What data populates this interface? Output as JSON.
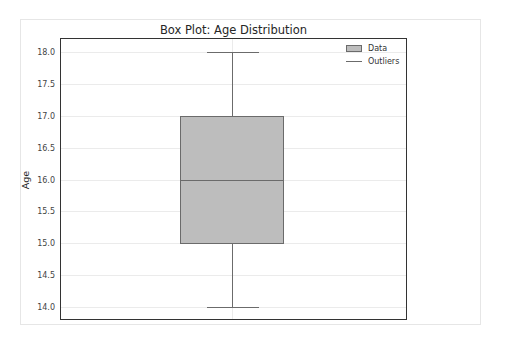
{
  "chart_data": {
    "type": "box",
    "title": "Box Plot: Age Distribution",
    "xlabel": "",
    "ylabel": "Age",
    "ylim": [
      13.8,
      18.2
    ],
    "yticks": [
      "14.0",
      "14.5",
      "15.0",
      "15.5",
      "16.0",
      "16.5",
      "17.0",
      "17.5",
      "18.0"
    ],
    "grid": true,
    "legend": {
      "position": "upper right",
      "entries": [
        "Data",
        "Outliers"
      ]
    },
    "series": [
      {
        "name": "Data",
        "min": 14.0,
        "q1": 15.0,
        "median": 16.0,
        "q3": 17.0,
        "max": 18.0,
        "outliers": []
      }
    ],
    "colors": {
      "box_fill": "#bdbdbd",
      "box_edge": "#6b6b6b"
    }
  }
}
